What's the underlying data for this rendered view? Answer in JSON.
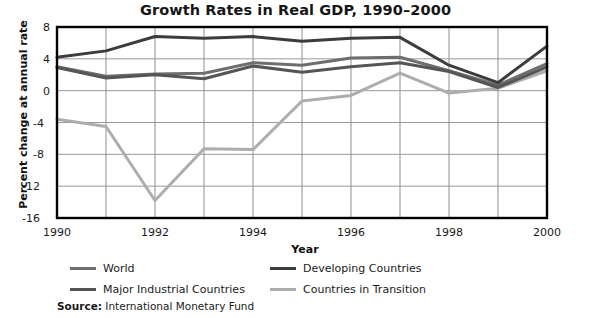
{
  "chart_data": {
    "type": "line",
    "title": "Growth Rates in Real GDP, 1990–2000",
    "xlabel": "Year",
    "ylabel": "Percent change at annual rate",
    "x": [
      1990,
      1991,
      1992,
      1993,
      1994,
      1995,
      1996,
      1997,
      1998,
      1999,
      2000
    ],
    "xlim": [
      1990,
      2000
    ],
    "ylim": [
      -16,
      8
    ],
    "xticks": [
      "1990",
      "1992",
      "1994",
      "1996",
      "1998",
      "2000"
    ],
    "yticks": [
      "8",
      "4",
      "0",
      "-4",
      "-8",
      "-12",
      "-16"
    ],
    "grid": true,
    "legend_position": "below-axes",
    "series": [
      {
        "name": "World",
        "color": "#6e6e6e",
        "values": [
          3.0,
          1.8,
          2.1,
          2.2,
          3.5,
          3.2,
          4.1,
          4.2,
          2.5,
          0.7,
          3.4
        ]
      },
      {
        "name": "Developing Countries",
        "color": "#3c3c3c",
        "values": [
          4.2,
          5.0,
          6.8,
          6.6,
          6.8,
          6.2,
          6.6,
          6.7,
          3.2,
          1.0,
          5.6
        ]
      },
      {
        "name": "Major Industrial Countries",
        "color": "#555555",
        "values": [
          2.9,
          1.6,
          2.0,
          1.5,
          3.1,
          2.3,
          3.0,
          3.5,
          2.4,
          0.4,
          3.0
        ]
      },
      {
        "name": "Countries in Transition",
        "color": "#adadad",
        "values": [
          -3.6,
          -4.5,
          -13.8,
          -7.3,
          -7.4,
          -1.3,
          -0.6,
          2.2,
          -0.3,
          0.3,
          2.5
        ]
      }
    ],
    "source_label": "Source:",
    "source_value": "International Monetary Fund"
  }
}
